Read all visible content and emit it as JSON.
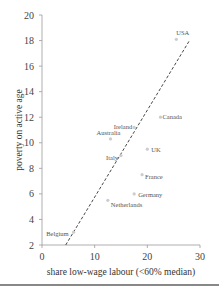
{
  "chart_data": {
    "type": "scatter",
    "title": "",
    "xlabel": "share low-wage labour (<60% median)",
    "ylabel": "poverty on active age",
    "xlim": [
      0,
      30
    ],
    "ylim": [
      2,
      20
    ],
    "x_ticks": [
      "0",
      "10",
      "20",
      "30"
    ],
    "y_ticks": [
      "2",
      "4",
      "6",
      "8",
      "10",
      "12",
      "14",
      "16",
      "18",
      "20"
    ],
    "grid": false,
    "legend": "none",
    "points": [
      {
        "label": "USA",
        "x": 25.5,
        "y": 18.1
      },
      {
        "label": "Canada",
        "x": 22.5,
        "y": 12.0
      },
      {
        "label": "Ireland",
        "x": 17.5,
        "y": 11.2
      },
      {
        "label": "Australia",
        "x": 13.0,
        "y": 10.3
      },
      {
        "label": "Italy",
        "x": 15.0,
        "y": 9.0
      },
      {
        "label": "UK",
        "x": 20.0,
        "y": 9.5
      },
      {
        "label": "France",
        "x": 19.0,
        "y": 7.5
      },
      {
        "label": "Germany",
        "x": 17.5,
        "y": 6.0
      },
      {
        "label": "Netherlands",
        "x": 12.5,
        "y": 5.5
      },
      {
        "label": "Belgium",
        "x": 6.0,
        "y": 3.0
      }
    ],
    "trendline": {
      "style": "dashed",
      "x": [
        4.5,
        28.0
      ],
      "y": [
        2.0,
        18.0
      ]
    }
  }
}
